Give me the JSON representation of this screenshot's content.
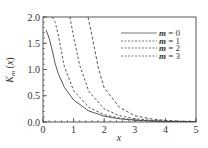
{
  "chart_data": {
    "type": "line",
    "title": "",
    "xlabel": "x",
    "ylabel": "K_m (x)",
    "xlim": [
      0,
      5
    ],
    "ylim": [
      0,
      2.0
    ],
    "xticks": [
      "0",
      "1",
      "2",
      "3",
      "4",
      "5"
    ],
    "yticks": [
      "0.0",
      "0.5",
      "1.0",
      "1.5",
      "2.0"
    ],
    "grid": false,
    "legend_position": "upper right",
    "series": [
      {
        "name": "m = 0",
        "style": "solid",
        "x": [
          0.1,
          0.2,
          0.3,
          0.4,
          0.5,
          0.7,
          1.0,
          1.5,
          2.0,
          2.5,
          3.0,
          3.5,
          4.0,
          4.5,
          5.0
        ],
        "y": [
          1.75,
          1.6,
          1.37,
          1.11,
          0.92,
          0.66,
          0.42,
          0.21,
          0.11,
          0.06,
          0.035,
          0.02,
          0.011,
          0.006,
          0.004
        ]
      },
      {
        "name": "m = 1",
        "style": "dashed",
        "x": [
          0.3,
          0.4,
          0.5,
          0.7,
          1.0,
          1.5,
          2.0,
          2.5,
          3.0,
          3.5,
          4.0,
          4.5,
          5.0
        ],
        "y": [
          2.0,
          1.9,
          1.66,
          1.05,
          0.6,
          0.28,
          0.14,
          0.074,
          0.04,
          0.022,
          0.012,
          0.007,
          0.004
        ]
      },
      {
        "name": "m = 2",
        "style": "dashed",
        "x": [
          0.88,
          1.0,
          1.2,
          1.5,
          2.0,
          2.5,
          3.0,
          3.5,
          4.0,
          4.5,
          5.0
        ],
        "y": [
          2.0,
          1.62,
          1.08,
          0.58,
          0.25,
          0.12,
          0.062,
          0.033,
          0.018,
          0.01,
          0.005
        ]
      },
      {
        "name": "m = 3",
        "style": "dashed",
        "x": [
          1.47,
          1.6,
          1.8,
          2.0,
          2.5,
          3.0,
          3.5,
          4.0,
          4.5,
          5.0
        ],
        "y": [
          2.0,
          1.65,
          1.05,
          0.65,
          0.28,
          0.12,
          0.06,
          0.03,
          0.016,
          0.008
        ]
      }
    ]
  }
}
